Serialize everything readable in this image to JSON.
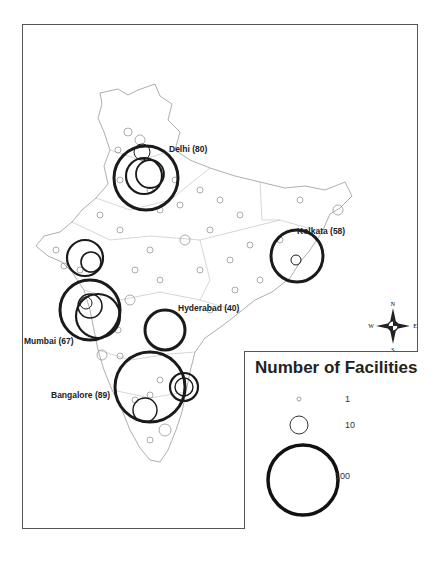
{
  "map": {
    "region": "India",
    "city_labels": [
      {
        "name": "Delhi",
        "count": 80,
        "text": "Delhi (80)"
      },
      {
        "name": "Kolkata",
        "count": 58,
        "text": "Kolkata (58)"
      },
      {
        "name": "Hyderabad",
        "count": 40,
        "text": "Hyderabad (40)"
      },
      {
        "name": "Mumbai",
        "count": 67,
        "text": "Mumbai (67)"
      },
      {
        "name": "Bangalore",
        "count": 89,
        "text": "Bangalore (89)"
      }
    ]
  },
  "legend": {
    "title": "Number of Facilities",
    "entries": [
      {
        "label": "1"
      },
      {
        "label": "10"
      },
      {
        "label": "100"
      }
    ]
  },
  "compass": {
    "n": "N",
    "s": "S",
    "e": "E",
    "w": "W"
  }
}
